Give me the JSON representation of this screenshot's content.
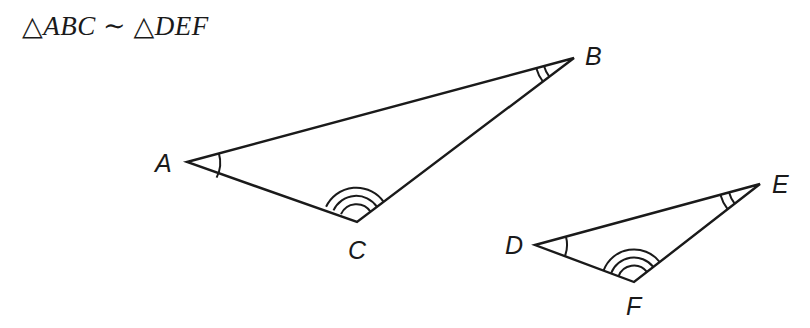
{
  "statement": {
    "triangle_symbol": "△",
    "first": "ABC",
    "similar_symbol": "∼",
    "second": "DEF"
  },
  "triangles": [
    {
      "name": "ABC",
      "vertices": [
        {
          "label": "A",
          "x": 187,
          "y": 162,
          "angle_marks": 1
        },
        {
          "label": "B",
          "x": 574,
          "y": 58,
          "angle_marks": 2
        },
        {
          "label": "C",
          "x": 357,
          "y": 222,
          "angle_marks": 3
        }
      ]
    },
    {
      "name": "DEF",
      "vertices": [
        {
          "label": "D",
          "x": 535,
          "y": 245,
          "angle_marks": 1
        },
        {
          "label": "E",
          "x": 760,
          "y": 184,
          "angle_marks": 2
        },
        {
          "label": "F",
          "x": 634,
          "y": 282,
          "angle_marks": 3
        }
      ]
    }
  ],
  "labels": {
    "A": "A",
    "B": "B",
    "C": "C",
    "D": "D",
    "E": "E",
    "F": "F"
  },
  "colors": {
    "stroke": "#1a1a1a",
    "background": "#ffffff"
  }
}
